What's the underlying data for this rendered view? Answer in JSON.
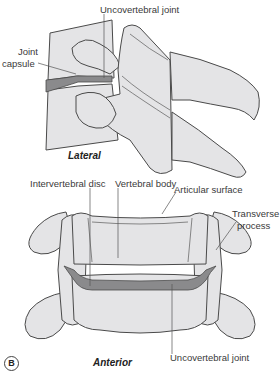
{
  "figure": {
    "panel_label": "B",
    "colors": {
      "bone_fill": "#e4e4e6",
      "bone_stroke": "#4a4a4a",
      "disc_fill": "#8a8a8c",
      "leader_line": "#555555"
    },
    "lateral_view": {
      "title": "Lateral",
      "labels": {
        "uncovertebral_joint": "Uncovertebral joint",
        "joint_capsule_line1": "Joint",
        "joint_capsule_line2": "capsule"
      }
    },
    "anterior_view": {
      "title": "Anterior",
      "labels": {
        "intervertebral_disc": "Intervertebral disc",
        "vertebral_body": "Vertebral body",
        "articular_surface": "Articular surface",
        "transverse_process_line1": "Transverse",
        "transverse_process_line2": "process",
        "uncovertebral_joint": "Uncovertebral joint"
      }
    }
  }
}
